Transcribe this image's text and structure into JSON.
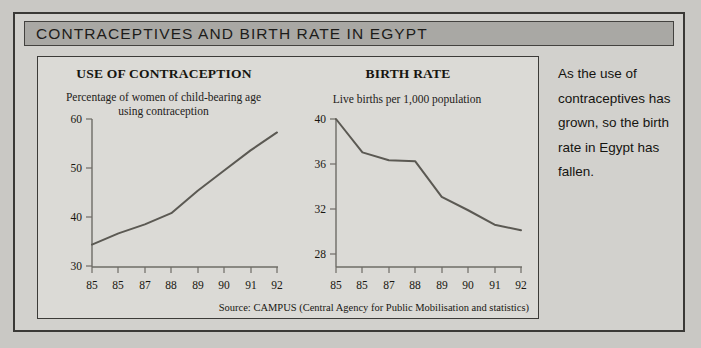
{
  "figure": {
    "title": "CONTRACEPTIVES AND BIRTH RATE IN EGYPT",
    "source": "Source: CAMPUS (Central Agency for Public Mobilisation and statistics)",
    "caption": "As the use of contraceptives has grown, so the birth rate in Egypt has fallen.",
    "colors": {
      "page_background": "#c9c8c4",
      "panel_background": "#dbdad6",
      "title_bar": "#a9a8a4",
      "border": "#3a3936",
      "data_line": "#5b5953",
      "axis": "#6e6c66"
    }
  },
  "chart_data": [
    {
      "type": "line",
      "id": "use-of-contraception",
      "title": "USE OF CONTRACEPTION",
      "subtitle": "Percentage of women of child-bearing age using contraception",
      "xlabel": "",
      "ylabel": "",
      "x": [
        85,
        86,
        87,
        88,
        89,
        90,
        91,
        92
      ],
      "xticklabels": [
        "85",
        "85",
        "87",
        "88",
        "89",
        "90",
        "91",
        "92"
      ],
      "values": [
        32,
        34.5,
        36.5,
        39,
        44,
        48.5,
        53,
        57
      ],
      "yticks": [
        30,
        40,
        50,
        60
      ],
      "yticklabels": [
        "30",
        "40",
        "50",
        "60"
      ],
      "ylim": [
        27,
        60
      ],
      "xlim": [
        85,
        92
      ],
      "grid": false,
      "legend": "none"
    },
    {
      "type": "line",
      "id": "birth-rate",
      "title": "BIRTH RATE",
      "subtitle": "Live births per 1,000 population",
      "xlabel": "",
      "ylabel": "",
      "x": [
        85,
        86,
        87,
        88,
        89,
        90,
        91,
        92
      ],
      "xticklabels": [
        "85",
        "85",
        "87",
        "88",
        "89",
        "90",
        "91",
        "92"
      ],
      "values": [
        40,
        37,
        36.3,
        36.2,
        33,
        31.8,
        30.5,
        30
      ],
      "yticks": [
        28,
        32,
        36,
        40
      ],
      "yticklabels": [
        "28",
        "32",
        "36",
        "40"
      ],
      "ylim": [
        26.7,
        40
      ],
      "xlim": [
        85,
        92
      ],
      "grid": false,
      "legend": "none"
    }
  ]
}
